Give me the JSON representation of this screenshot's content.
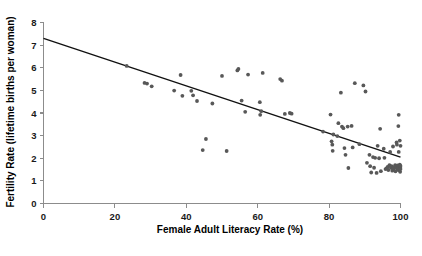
{
  "chart_data": {
    "type": "scatter",
    "title": "",
    "xlabel": "Female Adult Literacy Rate (%)",
    "ylabel": "Fertility Rate (lifetime births per woman)",
    "xlim": [
      0,
      100
    ],
    "ylim": [
      0,
      8
    ],
    "xticks": [
      0,
      20,
      40,
      60,
      80,
      100
    ],
    "yticks": [
      0,
      1,
      2,
      3,
      4,
      5,
      6,
      7,
      8
    ],
    "xtick_labels": [
      "0",
      "20",
      "40",
      "60",
      "80",
      "100"
    ],
    "ytick_labels": [
      "0",
      "1",
      "2",
      "3",
      "4",
      "5",
      "6",
      "7",
      "8"
    ],
    "grid": false,
    "legend": null,
    "point_color": "#585858",
    "line_color": "#111111",
    "axis_color": "#8c8c8c",
    "trend_line": {
      "type": "linear-fit",
      "x": [
        0,
        100
      ],
      "y": [
        7.3,
        2.05
      ]
    },
    "points": [
      [
        23.3,
        6.08
      ],
      [
        28.3,
        5.33
      ],
      [
        29.0,
        5.3
      ],
      [
        30.3,
        5.18
      ],
      [
        36.6,
        4.99
      ],
      [
        38.4,
        5.68
      ],
      [
        38.9,
        4.76
      ],
      [
        41.4,
        4.98
      ],
      [
        41.9,
        4.78
      ],
      [
        43.0,
        4.53
      ],
      [
        44.6,
        2.36
      ],
      [
        45.5,
        2.85
      ],
      [
        47.3,
        4.42
      ],
      [
        50.0,
        5.64
      ],
      [
        51.3,
        2.32
      ],
      [
        54.3,
        5.88
      ],
      [
        54.6,
        5.95
      ],
      [
        55.5,
        4.55
      ],
      [
        56.5,
        4.05
      ],
      [
        57.3,
        5.7
      ],
      [
        60.6,
        4.48
      ],
      [
        61.0,
        4.08
      ],
      [
        60.7,
        3.92
      ],
      [
        61.4,
        5.77
      ],
      [
        66.3,
        5.5
      ],
      [
        66.8,
        5.43
      ],
      [
        67.6,
        3.96
      ],
      [
        69.0,
        4.0
      ],
      [
        69.5,
        3.97
      ],
      [
        78.3,
        3.18
      ],
      [
        80.4,
        3.93
      ],
      [
        80.7,
        2.75
      ],
      [
        80.9,
        2.6
      ],
      [
        81.2,
        3.05
      ],
      [
        81.0,
        2.33
      ],
      [
        82.3,
        2.98
      ],
      [
        82.6,
        3.55
      ],
      [
        83.3,
        4.9
      ],
      [
        83.6,
        3.4
      ],
      [
        84.0,
        3.33
      ],
      [
        84.3,
        2.45
      ],
      [
        84.6,
        2.15
      ],
      [
        85.2,
        3.4
      ],
      [
        85.4,
        1.57
      ],
      [
        86.3,
        3.43
      ],
      [
        86.6,
        2.48
      ],
      [
        87.2,
        5.32
      ],
      [
        88.5,
        2.62
      ],
      [
        89.6,
        5.22
      ],
      [
        90.2,
        4.95
      ],
      [
        90.6,
        1.8
      ],
      [
        91.3,
        2.15
      ],
      [
        91.5,
        1.65
      ],
      [
        91.8,
        1.37
      ],
      [
        92.3,
        2.05
      ],
      [
        92.6,
        1.58
      ],
      [
        92.9,
        2.02
      ],
      [
        93.3,
        1.35
      ],
      [
        93.6,
        2.55
      ],
      [
        94.0,
        2.0
      ],
      [
        94.3,
        3.3
      ],
      [
        94.5,
        1.43
      ],
      [
        95.3,
        2.42
      ],
      [
        95.5,
        2.02
      ],
      [
        95.8,
        1.52
      ],
      [
        96.1,
        1.55
      ],
      [
        96.4,
        1.62
      ],
      [
        96.6,
        1.48
      ],
      [
        96.9,
        1.7
      ],
      [
        97.1,
        2.28
      ],
      [
        97.3,
        1.58
      ],
      [
        97.5,
        1.65
      ],
      [
        97.7,
        1.45
      ],
      [
        97.9,
        2.52
      ],
      [
        98.1,
        1.55
      ],
      [
        98.3,
        1.62
      ],
      [
        98.5,
        1.7
      ],
      [
        98.6,
        1.42
      ],
      [
        98.8,
        1.6
      ],
      [
        98.9,
        2.7
      ],
      [
        99.0,
        2.6
      ],
      [
        99.1,
        1.5
      ],
      [
        99.2,
        1.68
      ],
      [
        99.3,
        1.58
      ],
      [
        99.4,
        3.42
      ],
      [
        99.5,
        3.92
      ],
      [
        99.5,
        2.28
      ],
      [
        99.6,
        1.47
      ],
      [
        99.6,
        1.63
      ],
      [
        99.7,
        1.55
      ],
      [
        99.8,
        2.78
      ],
      [
        99.8,
        1.72
      ],
      [
        99.9,
        1.4
      ],
      [
        99.9,
        1.6
      ],
      [
        100.0,
        1.52
      ],
      [
        100.0,
        2.55
      ],
      [
        100.0,
        1.66
      ]
    ]
  }
}
